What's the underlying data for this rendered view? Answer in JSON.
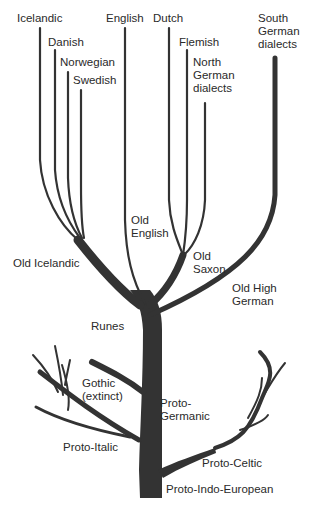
{
  "diagram": {
    "type": "language-family-tree",
    "colors": {
      "branch": "#333333",
      "text": "#2a2a2a",
      "background": "#ffffff"
    },
    "labels": {
      "icelandic": "Icelandic",
      "danish": "Danish",
      "norwegian": "Norwegian",
      "swedish": "Swedish",
      "english": "English",
      "dutch": "Dutch",
      "flemish": "Flemish",
      "north_german_dialects": "North\nGerman\ndialects",
      "south_german_dialects": "South\nGerman\ndialects",
      "old_english": "Old\nEnglish",
      "old_icelandic": "Old Icelandic",
      "old_saxon": "Old\nSaxon",
      "old_high_german": "Old High\nGerman",
      "runes": "Runes",
      "gothic": "Gothic\n(extinct)",
      "proto_germanic": "Proto-\nGermanic",
      "proto_italic": "Proto-Italic",
      "proto_celtic": "Proto-Celtic",
      "proto_indo_european": "Proto-Indo-European"
    },
    "hierarchy": {
      "root": "Proto-Indo-European",
      "children": [
        {
          "name": "Proto-Italic",
          "children": []
        },
        {
          "name": "Proto-Celtic",
          "children": []
        },
        {
          "name": "Proto-Germanic",
          "children": [
            {
              "name": "Gothic (extinct)"
            },
            {
              "name": "Runes"
            },
            {
              "name": "Old Icelandic",
              "children": [
                "Icelandic",
                "Danish",
                "Norwegian",
                "Swedish"
              ]
            },
            {
              "name": "Old English",
              "children": [
                "English"
              ]
            },
            {
              "name": "Old Saxon",
              "children": [
                "Dutch",
                "Flemish",
                "North German dialects"
              ]
            },
            {
              "name": "Old High German",
              "children": [
                "South German dialects"
              ]
            }
          ]
        }
      ]
    }
  }
}
